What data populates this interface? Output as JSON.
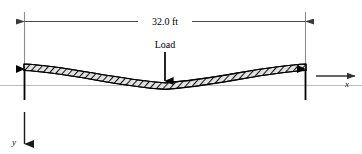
{
  "figure": {
    "background_color": "#ffffff"
  },
  "dimension": {
    "label": "32.0 ft",
    "line_color": "#555555",
    "extension_color": "#888888"
  },
  "load": {
    "label": "Load",
    "arrow_color": "#000000"
  },
  "axes": {
    "x_label": "x",
    "y_label": "y",
    "reference_line_color": "#b9b9b9",
    "arrow_color": "#333333"
  },
  "beam": {
    "fill_color": "#d8d8d8",
    "outline_color": "#000000",
    "hatch_color": "#1a1a1a"
  },
  "supports": {
    "left_reaction_color": "#000000",
    "right_reaction_color": "#000000"
  }
}
